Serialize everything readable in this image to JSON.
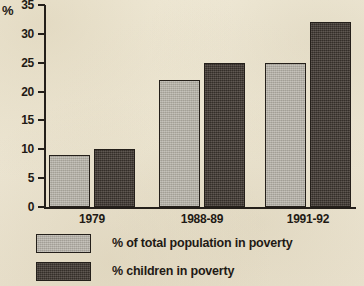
{
  "chart_data": {
    "type": "bar",
    "title": "",
    "xlabel": "",
    "ylabel": "%",
    "categories": [
      "1979",
      "1988-89",
      "1991-92"
    ],
    "series": [
      {
        "name": "% of total population in poverty",
        "values": [
          9,
          22,
          25
        ],
        "color": "#b2aea4"
      },
      {
        "name": "% children in poverty",
        "values": [
          10,
          25,
          32
        ],
        "color": "#463e37"
      }
    ],
    "ylim": [
      0,
      35
    ],
    "y_ticks": [
      0,
      5,
      10,
      15,
      20,
      25,
      30,
      35
    ],
    "y_tick_labels": [
      "0",
      "5",
      "10",
      "15",
      "20",
      "25",
      "30",
      "35"
    ],
    "grid": false,
    "legend_position": "bottom-left",
    "background_color": "#efe9d7",
    "axis_color": "#241f1a"
  },
  "axis": {
    "y_title": "%"
  },
  "legend": {
    "items": [
      {
        "label": "% of total population in poverty",
        "swatch": "light-grey-swatch"
      },
      {
        "label": "% children in poverty",
        "swatch": "dark-grey-swatch"
      }
    ]
  }
}
